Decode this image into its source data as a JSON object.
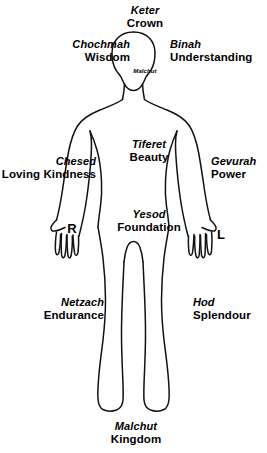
{
  "diagram": {
    "background_color": "#ffffff",
    "stroke_color": "#000000"
  },
  "labels": {
    "keter": {
      "hebrew": "Keter",
      "english": "Crown",
      "x": 145,
      "y": 4,
      "align": "center"
    },
    "chochmah": {
      "hebrew": "Chochmah",
      "english": "Wisdom",
      "x": 130,
      "y": 38,
      "align": "right"
    },
    "binah": {
      "hebrew": "Binah",
      "english": "Understanding",
      "x": 170,
      "y": 38,
      "align": "left"
    },
    "chesed": {
      "hebrew": "Chesed",
      "english": "Loving Kindness",
      "x": 96,
      "y": 155,
      "align": "right"
    },
    "gevurah": {
      "hebrew": "Gevurah",
      "english": "Power",
      "x": 211,
      "y": 155,
      "align": "left"
    },
    "tiferet": {
      "hebrew": "Tiferet",
      "english": "Beauty",
      "x": 149,
      "y": 138,
      "align": "center"
    },
    "yesod": {
      "hebrew": "Yesod",
      "english": "Foundation",
      "x": 149,
      "y": 208,
      "align": "center"
    },
    "netzach": {
      "hebrew": "Netzach",
      "english": "Endurance",
      "x": 104,
      "y": 296,
      "align": "right"
    },
    "hod": {
      "hebrew": "Hod",
      "english": "Splendour",
      "x": 193,
      "y": 296,
      "align": "left"
    },
    "malchut": {
      "hebrew": "Malchut",
      "english": "Kingdom",
      "x": 136,
      "y": 420,
      "align": "center"
    }
  },
  "neck_label": {
    "text": "Malchut",
    "x": 145,
    "y": 68
  },
  "hands": {
    "right": {
      "letter": "R",
      "x": 72,
      "y": 228
    },
    "left": {
      "letter": "L",
      "x": 221,
      "y": 234
    }
  }
}
